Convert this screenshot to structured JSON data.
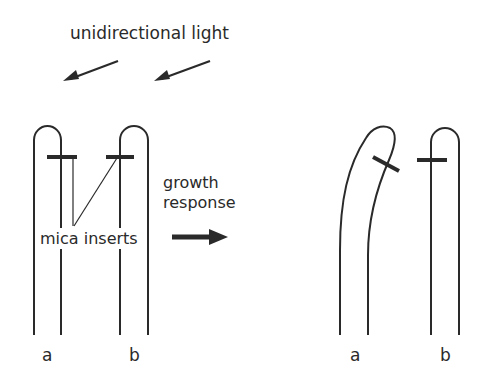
{
  "diagram": {
    "title": "unidirectional light",
    "growth_label_line1": "growth",
    "growth_label_line2": "response",
    "mica_label": "mica inserts",
    "before": {
      "coleoptile_a_label": "a",
      "coleoptile_b_label": "b"
    },
    "after": {
      "coleoptile_a_label": "a",
      "coleoptile_b_label": "b"
    },
    "colors": {
      "stroke": "#2a2a2a",
      "background": "#ffffff"
    },
    "icons": {
      "light_arrow": "arrow-down-left-icon",
      "response_arrow": "arrow-right-icon"
    }
  }
}
